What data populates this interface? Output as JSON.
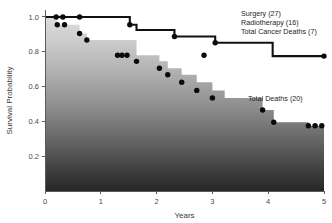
{
  "chart_data": {
    "type": "line",
    "title": "",
    "subtitle": "",
    "xlabel": "Years",
    "ylabel": "Survival Probability",
    "xlim": [
      0,
      5
    ],
    "ylim": [
      0,
      1.04
    ],
    "xticks": [
      0,
      1,
      2,
      3,
      4,
      5
    ],
    "xticklabels": [
      "0",
      "1",
      "2",
      "3",
      "4",
      "5"
    ],
    "yticks": [
      0.2,
      0.4,
      0.6,
      0.8,
      1.0
    ],
    "yticklabels": [
      "0.2",
      "0.4",
      "0.6",
      "0.8",
      "1.0"
    ],
    "grid": false,
    "legend_position": "inside-upper-right",
    "series": [
      {
        "name": "Total Cancer Deaths",
        "style": "step-post-black-line",
        "label_lines": [
          "Surgery (27)",
          "Radiotherapy (16)",
          "Total Cancer Deaths (7)"
        ],
        "x": [
          0.0,
          0.62,
          1.52,
          1.64,
          2.32,
          3.05,
          4.08,
          5.0
        ],
        "y": [
          1.0,
          1.0,
          0.955,
          0.925,
          0.888,
          0.852,
          0.775,
          0.775
        ],
        "event_markers": [
          {
            "x": 0.2,
            "y": 1.0
          },
          {
            "x": 0.32,
            "y": 1.0
          },
          {
            "x": 0.62,
            "y": 1.0
          },
          {
            "x": 1.52,
            "y": 0.955
          },
          {
            "x": 2.32,
            "y": 0.888
          },
          {
            "x": 3.05,
            "y": 0.852
          },
          {
            "x": 5.0,
            "y": 0.775
          }
        ]
      },
      {
        "name": "Total Deaths",
        "style": "step-post-gradient-area",
        "label_lines": [
          "Total Deaths (20)"
        ],
        "x": [
          0.0,
          0.22,
          0.35,
          0.62,
          0.75,
          1.52,
          1.64,
          2.05,
          2.2,
          2.45,
          2.72,
          3.0,
          3.22,
          3.9,
          4.1,
          4.72,
          5.0
        ],
        "y": [
          1.0,
          0.955,
          0.955,
          0.905,
          0.868,
          0.868,
          0.78,
          0.745,
          0.705,
          0.668,
          0.625,
          0.578,
          0.535,
          0.465,
          0.395,
          0.375,
          0.375
        ],
        "event_markers": [
          {
            "x": 0.22,
            "y": 0.955
          },
          {
            "x": 0.35,
            "y": 0.955
          },
          {
            "x": 0.62,
            "y": 0.905
          },
          {
            "x": 0.75,
            "y": 0.868
          },
          {
            "x": 1.3,
            "y": 0.78
          },
          {
            "x": 1.38,
            "y": 0.78
          },
          {
            "x": 1.47,
            "y": 0.78
          },
          {
            "x": 1.64,
            "y": 0.745
          },
          {
            "x": 2.05,
            "y": 0.705
          },
          {
            "x": 2.2,
            "y": 0.668
          },
          {
            "x": 2.45,
            "y": 0.625
          },
          {
            "x": 2.72,
            "y": 0.578
          },
          {
            "x": 3.0,
            "y": 0.535
          },
          {
            "x": 3.9,
            "y": 0.465
          },
          {
            "x": 4.1,
            "y": 0.395
          },
          {
            "x": 4.72,
            "y": 0.375
          },
          {
            "x": 4.84,
            "y": 0.375
          },
          {
            "x": 4.96,
            "y": 0.375
          }
        ]
      },
      {
        "name": "Unattached Marker",
        "style": "scatter-only",
        "label_lines": [],
        "x": [],
        "y": [],
        "event_markers": [
          {
            "x": 2.85,
            "y": 0.78
          }
        ]
      }
    ],
    "colors": {
      "line": "#111111",
      "marker": "#0b0b0b",
      "axis": "#5a5a5a",
      "text": "#262626",
      "area_gradient_top": "#d8d8d8",
      "area_gradient_bottom": "#2a2a2a",
      "background": "#ffffff"
    }
  },
  "axes": {
    "y_title": "Survival Probability",
    "x_title": "Years",
    "y_tick_labels": [
      "1.0",
      "0.8",
      "0.6",
      "0.4",
      "0.2"
    ],
    "x_tick_labels": [
      "0",
      "1",
      "2",
      "3",
      "4",
      "5"
    ]
  },
  "annotations": {
    "legend_line_1": "Surgery (27)",
    "legend_line_2": "Radiotherapy (16)",
    "legend_line_3": "Total Cancer Deaths (7)",
    "total_deaths_label": "Total Deaths (20)"
  }
}
